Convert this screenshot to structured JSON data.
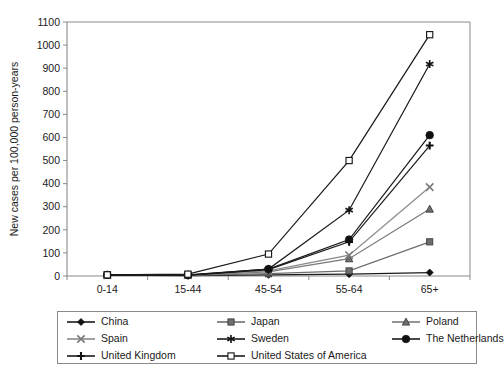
{
  "chart_data": {
    "type": "line",
    "title": "",
    "xlabel": "Age",
    "ylabel": "New cases per 100,000 person-years",
    "categories": [
      "0-14",
      "15-44",
      "45-54",
      "55-64",
      "65+"
    ],
    "ylim": [
      0,
      1100
    ],
    "yticks": [
      0,
      100,
      200,
      300,
      400,
      500,
      600,
      700,
      800,
      900,
      1000,
      1100
    ],
    "grid": false,
    "legend_position": "bottom",
    "series": [
      {
        "name": "China",
        "marker": "filled-diamond",
        "color": "#1a1a1a",
        "values": [
          4,
          2,
          5,
          8,
          15
        ]
      },
      {
        "name": "Japan",
        "marker": "filled-square-gray",
        "color": "#6e6e6e",
        "values": [
          4,
          3,
          10,
          22,
          148
        ]
      },
      {
        "name": "Poland",
        "marker": "filled-triangle-gray",
        "color": "#7a7a7a",
        "values": [
          4,
          3,
          18,
          75,
          290
        ]
      },
      {
        "name": "Spain",
        "marker": "cross-x-gray",
        "color": "#8a8a8a",
        "values": [
          4,
          4,
          22,
          90,
          385
        ]
      },
      {
        "name": "Sweden",
        "marker": "asterisk-black",
        "color": "#1a1a1a",
        "values": [
          4,
          5,
          30,
          285,
          918
        ]
      },
      {
        "name": "The Netherlands",
        "marker": "filled-circle",
        "color": "#1a1a1a",
        "values": [
          5,
          4,
          30,
          158,
          610
        ]
      },
      {
        "name": "United Kingdom",
        "marker": "plus",
        "color": "#1a1a1a",
        "values": [
          4,
          3,
          28,
          148,
          565
        ]
      },
      {
        "name": "United States of America",
        "marker": "open-square",
        "color": "#1a1a1a",
        "values": [
          5,
          8,
          95,
          500,
          1045
        ]
      }
    ]
  },
  "axis": {
    "x_label": "Age",
    "y_label": "New cases per 100,000 person-years",
    "x_tick_labels": [
      "0-14",
      "15-44",
      "45-54",
      "55-64",
      "65+"
    ],
    "y_tick_labels": [
      "0",
      "100",
      "200",
      "300",
      "400",
      "500",
      "600",
      "700",
      "800",
      "900",
      "1000",
      "1100"
    ]
  },
  "legend": {
    "entries": [
      {
        "label": "China"
      },
      {
        "label": "Japan"
      },
      {
        "label": "Poland"
      },
      {
        "label": "Spain"
      },
      {
        "label": "Sweden"
      },
      {
        "label": "The Netherlands"
      },
      {
        "label": "United Kingdom"
      },
      {
        "label": "United States of America"
      }
    ]
  },
  "colors": {
    "axis": "#8a8a8a",
    "text": "#1a1a1a",
    "dark_series": "#1a1a1a",
    "gray_series": "#7d7d7d",
    "background": "#ffffff",
    "legend_border": "#8a8a8a"
  }
}
